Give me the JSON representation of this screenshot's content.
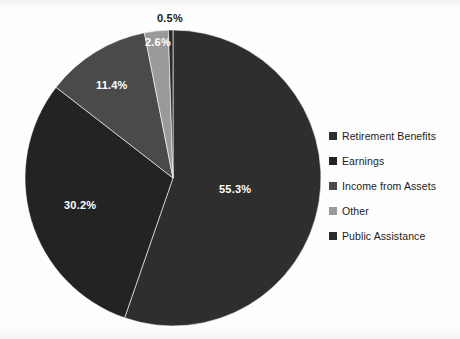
{
  "chart_data": {
    "type": "pie",
    "title": "",
    "subtitle": "",
    "xlabel": "",
    "ylabel": "",
    "legend_position": "right",
    "grid": false,
    "unit": "%",
    "start_angle_deg": 0,
    "direction": "clockwise",
    "categories": [
      "Retirement Benefits",
      "Earnings",
      "Income from Assets",
      "Other",
      "Public Assistance"
    ],
    "values": [
      55.3,
      30.2,
      11.4,
      2.6,
      0.5
    ],
    "labels": [
      "55.3%",
      "30.2%",
      "11.4%",
      "2.6%",
      "0.5%"
    ],
    "colors": [
      "#2e2e2e",
      "#232323",
      "#4a4a4a",
      "#9a9a9a",
      "#2b2b2b"
    ],
    "slices": [
      {
        "name": "Retirement Benefits",
        "value": 55.3,
        "label": "55.3%",
        "color": "#2e2e2e",
        "label_placement": "inside",
        "label_x": 219,
        "label_y": 183
      },
      {
        "name": "Earnings",
        "value": 30.2,
        "label": "30.2%",
        "color": "#232323",
        "label_placement": "inside",
        "label_x": 64,
        "label_y": 199
      },
      {
        "name": "Income from Assets",
        "value": 11.4,
        "label": "11.4%",
        "color": "#4a4a4a",
        "label_placement": "inside",
        "label_x": 96,
        "label_y": 79
      },
      {
        "name": "Other",
        "value": 2.6,
        "label": "2.6%",
        "color": "#9a9a9a",
        "label_placement": "inside",
        "label_x": 145,
        "label_y": 36
      },
      {
        "name": "Public Assistance",
        "value": 0.5,
        "label": "0.5%",
        "color": "#2b2b2b",
        "label_placement": "outside",
        "label_x": 157,
        "label_y": 12
      }
    ]
  },
  "legend": {
    "items": [
      {
        "label": "Retirement Benefits",
        "color": "#2e2e2e"
      },
      {
        "label": "Earnings",
        "color": "#232323"
      },
      {
        "label": "Income from Assets",
        "color": "#4a4a4a"
      },
      {
        "label": "Other",
        "color": "#9a9a9a"
      },
      {
        "label": "Public Assistance",
        "color": "#2b2b2b"
      }
    ]
  },
  "geometry": {
    "center_x": 173,
    "center_y": 178,
    "radius": 148
  }
}
